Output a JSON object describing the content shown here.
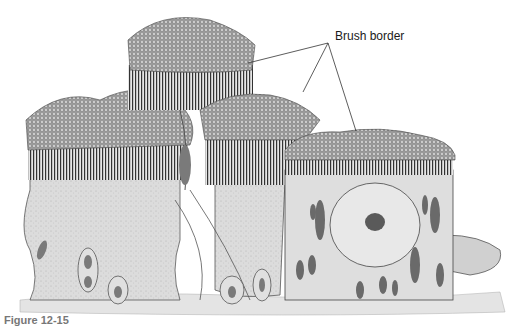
{
  "figure": {
    "labels": [
      {
        "text": "Brush border",
        "x": 335,
        "y": 37
      }
    ],
    "leader_lines": [
      {
        "from": [
          328,
          43
        ],
        "to": [
          248,
          63
        ]
      },
      {
        "from": [
          328,
          43
        ],
        "to": [
          303,
          92
        ]
      },
      {
        "from": [
          328,
          43
        ],
        "to": [
          356,
          131
        ]
      }
    ],
    "caption": "Figure 12-15",
    "signature": "artist signature",
    "colors": {
      "microvilli": "#6e6e6e",
      "cytoplasm": "#d9d9d9",
      "cell_outline": "#4a4a4a",
      "nucleus": "#8a8a8a",
      "basement": "#cfcfcf",
      "label_text": "#1a1a1a"
    }
  }
}
